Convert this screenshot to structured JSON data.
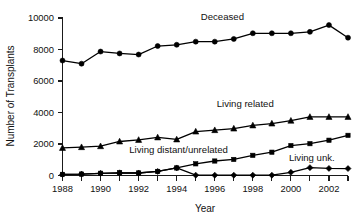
{
  "chart_data": {
    "type": "line",
    "title": "",
    "xlabel": "Year",
    "ylabel": "Number of Transplants",
    "xlim": [
      1988,
      2003
    ],
    "ylim": [
      0,
      10000
    ],
    "grid": false,
    "legend_position": "inline-annotations",
    "x": [
      1988,
      1989,
      1990,
      1991,
      1992,
      1993,
      1994,
      1995,
      1996,
      1997,
      1998,
      1999,
      2000,
      2001,
      2002,
      2003
    ],
    "y_ticks": [
      0,
      2000,
      4000,
      6000,
      8000,
      10000
    ],
    "y_tick_labels": [
      "0",
      "2000",
      "4000",
      "6000",
      "8000",
      "10000"
    ],
    "x_ticks": [
      1988,
      1989,
      1990,
      1991,
      1992,
      1993,
      1994,
      1995,
      1996,
      1997,
      1998,
      1999,
      2000,
      2001,
      2002,
      2003
    ],
    "x_tick_labels_shown": [
      "1988",
      "1990",
      "1992",
      "1994",
      "1996",
      "1998",
      "2000",
      "2002"
    ],
    "x_tick_labels_years": [
      1988,
      1990,
      1992,
      1994,
      1996,
      1998,
      2000,
      2002
    ],
    "series": [
      {
        "name": "Deceased",
        "marker": "circle",
        "color": "#000000",
        "label_x": 1996.4,
        "label_y": 9850,
        "values": [
          7300,
          7100,
          7870,
          7750,
          7680,
          8220,
          8300,
          8500,
          8500,
          8670,
          9030,
          9030,
          9030,
          9120,
          9550,
          8750
        ]
      },
      {
        "name": "Living related",
        "marker": "triangle",
        "color": "#000000",
        "label_x": 1997.6,
        "label_y": 4320,
        "values": [
          1750,
          1800,
          1860,
          2160,
          2260,
          2420,
          2290,
          2790,
          2880,
          2980,
          3180,
          3300,
          3480,
          3720,
          3720,
          3720
        ]
      },
      {
        "name": "Living distant/unrelated",
        "marker": "square",
        "color": "#000000",
        "label_x": 1994.1,
        "label_y": 1460,
        "values": [
          70,
          90,
          140,
          170,
          160,
          260,
          480,
          740,
          920,
          1020,
          1280,
          1480,
          1900,
          2020,
          2240,
          2550
        ]
      },
      {
        "name": "Living unk.",
        "marker": "diamond",
        "color": "#000000",
        "label_x": 2001.1,
        "label_y": 950,
        "values": [
          70,
          90,
          140,
          170,
          160,
          260,
          480,
          20,
          20,
          20,
          20,
          20,
          200,
          500,
          450,
          440
        ]
      }
    ]
  },
  "axes": {
    "x_title": "Year",
    "y_title": "Number of Transplants"
  }
}
